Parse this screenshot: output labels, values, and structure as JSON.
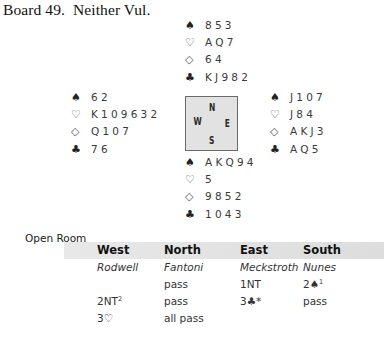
{
  "title": "Board 49.  Neither Vul.",
  "hands": {
    "north": {
      "spades": "853",
      "hearts": "AQ7",
      "diamonds": "64",
      "clubs": "KJ982"
    },
    "west": {
      "spades": "62",
      "hearts": "K109632",
      "diamonds": "Q107",
      "clubs": "76"
    },
    "east": {
      "spades": "J107",
      "hearts": "J84",
      "diamonds": "AKJ3",
      "clubs": "AQ5"
    },
    "south": {
      "spades": "AKQ94",
      "hearts": "5",
      "diamonds": "9852",
      "clubs": "1043"
    }
  },
  "suit_icons": {
    "spades": "♠",
    "hearts": "♡",
    "diamonds": "◇",
    "clubs": "♣"
  },
  "compass": {
    "n": "N",
    "w": "W",
    "e": "E",
    "s": "S"
  },
  "room": "Open Room",
  "auction": {
    "headers": [
      "West",
      "North",
      "East",
      "South"
    ],
    "players": [
      "Rodwell",
      "Fantoni",
      "Meckstroth",
      "Nunes"
    ],
    "rounds": [
      [
        {
          "bid": ""
        },
        {
          "bid": "pass"
        },
        {
          "bid": "1NT"
        },
        {
          "bid": "2♠",
          "sup": "1"
        }
      ],
      [
        {
          "bid": "2NT",
          "sup": "2"
        },
        {
          "bid": "pass"
        },
        {
          "bid": "3♣*"
        },
        {
          "bid": "pass"
        }
      ],
      [
        {
          "bid": "3♡"
        },
        {
          "bid": "all pass"
        },
        {
          "bid": ""
        },
        {
          "bid": ""
        }
      ]
    ]
  }
}
